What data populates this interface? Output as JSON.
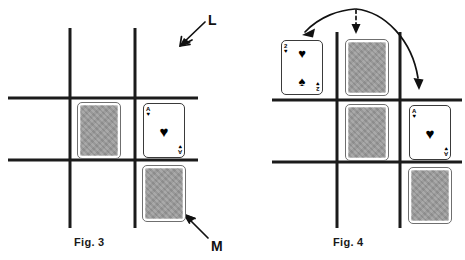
{
  "figures": [
    {
      "id": "fig3",
      "caption": "Fig. 3",
      "grid": {
        "vertical_lines_x": [
          70,
          135
        ],
        "horizontal_lines_y": [
          98,
          160
        ],
        "line_color": "#1b1b1b",
        "line_width": 3
      },
      "cells": [
        {
          "name": "center-left",
          "card": "face-down"
        },
        {
          "name": "center-right",
          "card": "ace-of-hearts"
        },
        {
          "name": "bottom-right",
          "card": "face-down"
        }
      ],
      "annotations": [
        {
          "label": "L",
          "target": "top-right-grid-area",
          "arrow": "down-left",
          "style": "solid"
        },
        {
          "label": "M",
          "target": "bottom-right-face-down-card",
          "arrow": "up-left",
          "style": "solid"
        }
      ]
    },
    {
      "id": "fig4",
      "caption": "Fig. 4",
      "grid": {
        "vertical_lines_x": [
          337,
          400
        ],
        "horizontal_lines_y": [
          100,
          162
        ],
        "line_color": "#1b1b1b",
        "line_width": 3
      },
      "cells": [
        {
          "name": "top-left",
          "card": "two-of-hearts-spades"
        },
        {
          "name": "top-center",
          "card": "face-down"
        },
        {
          "name": "center-center",
          "card": "face-down"
        },
        {
          "name": "center-right",
          "card": "ace-of-hearts"
        },
        {
          "name": "bottom-right",
          "card": "face-down"
        }
      ],
      "annotations": [
        {
          "label": "",
          "target": "top-left-card",
          "arrow": "curved-left",
          "style": "solid"
        },
        {
          "label": "",
          "target": "top-center-card",
          "arrow": "straight-down",
          "style": "dashed"
        },
        {
          "label": "",
          "target": "center-right-card",
          "arrow": "curved-right",
          "style": "solid"
        }
      ]
    }
  ],
  "cards": {
    "ace_of_hearts": {
      "rank": "A",
      "suit_symbol": "♥",
      "center_pips": [
        "♥"
      ],
      "corner_rank": "A",
      "corner_suit": "♥"
    },
    "two_of_hearts_spades": {
      "rank": "2",
      "suit_symbol": "♥",
      "center_pips": [
        "♥",
        "♠"
      ],
      "corner_rank": "2",
      "corner_suit": "♥"
    },
    "face_down": {
      "label": "card back",
      "back_color": "#9a9a9a",
      "border_color": "#ffffff"
    }
  },
  "colors": {
    "ink": "#111111",
    "grid": "#1b1b1b",
    "card_back": "#9a9a9a",
    "card_face": "#ffffff",
    "background": "#ffffff"
  },
  "labels": {
    "L": "L",
    "M": "M",
    "fig3": "Fig. 3",
    "fig4": "Fig. 4"
  }
}
